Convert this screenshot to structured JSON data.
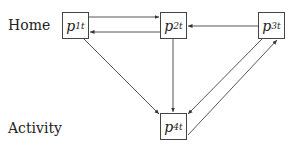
{
  "rows": {
    "home": "Home",
    "activity": "Activity"
  },
  "nodes": [
    {
      "id": "p1t",
      "base": "p",
      "sub": "1t"
    },
    {
      "id": "p2t",
      "base": "p",
      "sub": "2t"
    },
    {
      "id": "p3t",
      "base": "p",
      "sub": "3t"
    },
    {
      "id": "p4t",
      "base": "p",
      "sub": "4t"
    }
  ],
  "edges": [
    {
      "from": "p1t",
      "to": "p2t"
    },
    {
      "from": "p2t",
      "to": "p1t"
    },
    {
      "from": "p3t",
      "to": "p2t"
    },
    {
      "from": "p1t",
      "to": "p4t"
    },
    {
      "from": "p2t",
      "to": "p4t"
    },
    {
      "from": "p3t",
      "to": "p4t"
    },
    {
      "from": "p4t",
      "to": "p3t"
    }
  ]
}
